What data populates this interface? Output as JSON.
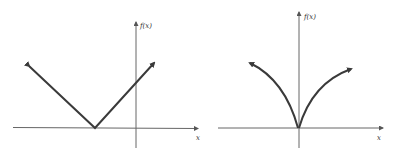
{
  "figures": [
    {
      "id": "left",
      "description": "Absolute value graph shifted left (V-shape with vertex on negative x-axis)",
      "y_axis_label": "f(x)",
      "x_axis_label": "x",
      "curve_type": "linear-v"
    },
    {
      "id": "right",
      "description": "Cusp graph with vertex at origin, concave-down curved branches",
      "y_axis_label": "f(x)",
      "x_axis_label": "x",
      "curve_type": "cusp"
    }
  ],
  "colors": {
    "stroke": "#444444",
    "axis": "#555555",
    "background": "#ffffff"
  }
}
